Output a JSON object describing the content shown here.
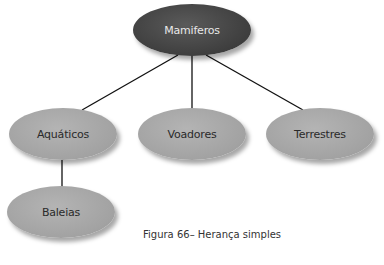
{
  "diagram": {
    "root": {
      "label": "Mamiferos",
      "color": "#444444"
    },
    "children": [
      {
        "label": "Aquáticos",
        "color": "#a8a8a8"
      },
      {
        "label": "Voadores",
        "color": "#a8a8a8"
      },
      {
        "label": "Terrestres",
        "color": "#a8a8a8"
      }
    ],
    "grandchildren": [
      {
        "label": "Baleias",
        "parent": "Aquáticos",
        "color": "#a8a8a8"
      }
    ],
    "edges": [
      [
        "Mamiferos",
        "Aquáticos"
      ],
      [
        "Mamiferos",
        "Voadores"
      ],
      [
        "Mamiferos",
        "Terrestres"
      ],
      [
        "Aquáticos",
        "Baleias"
      ]
    ]
  },
  "caption": "Figura 66– Herança simples"
}
